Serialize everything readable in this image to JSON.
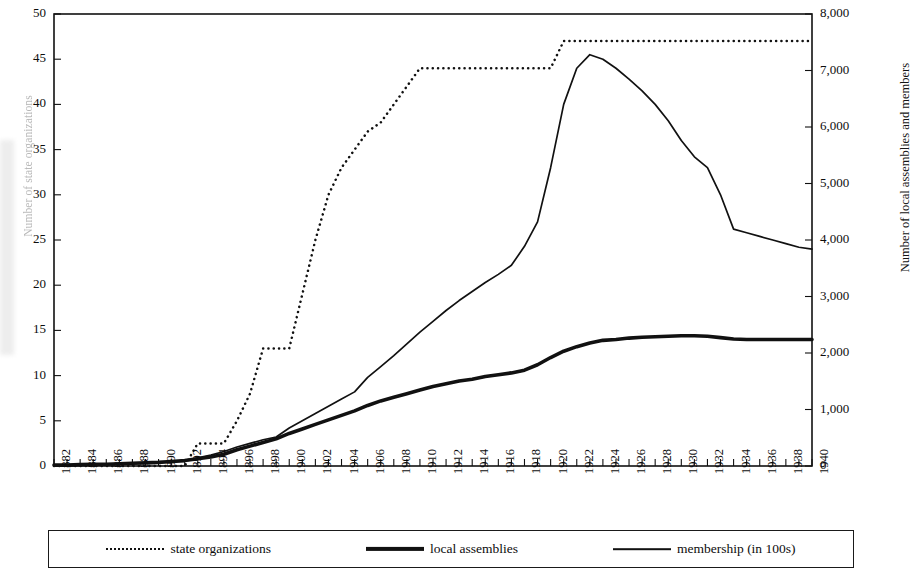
{
  "chart_data": {
    "type": "line",
    "title": "",
    "xlabel": "",
    "ylabel_left": "Number of state organizations",
    "ylabel_right": "Number of local assemblies and members",
    "xlim": [
      1882,
      1940
    ],
    "ylim_left": [
      0,
      50
    ],
    "ylim_right": [
      0,
      8000
    ],
    "grid": false,
    "legend_position": "bottom",
    "x_tick_labels": [
      "1882",
      "1884",
      "1886",
      "1888",
      "1890",
      "1892",
      "1894",
      "1896",
      "1898",
      "1900",
      "1902",
      "1904",
      "1906",
      "1908",
      "1910",
      "1912",
      "1914",
      "1916",
      "1918",
      "1920",
      "1922",
      "1924",
      "1926",
      "1928",
      "1930",
      "1932",
      "1934",
      "1936",
      "1938",
      "1940"
    ],
    "y_tick_labels_left": [
      "0",
      "5",
      "10",
      "15",
      "20",
      "25",
      "30",
      "35",
      "40",
      "45",
      "50"
    ],
    "y_tick_labels_right": [
      "0",
      "1,000",
      "2,000",
      "3,000",
      "4,000",
      "5,000",
      "6,000",
      "7,000",
      "8,000"
    ],
    "y_ticks_left": [
      0,
      5,
      10,
      15,
      20,
      25,
      30,
      35,
      40,
      45,
      50
    ],
    "y_ticks_right": [
      0,
      1000,
      2000,
      3000,
      4000,
      5000,
      6000,
      7000,
      8000
    ],
    "x": [
      1882,
      1883,
      1884,
      1885,
      1886,
      1887,
      1888,
      1889,
      1890,
      1891,
      1892,
      1893,
      1894,
      1895,
      1896,
      1897,
      1898,
      1899,
      1900,
      1901,
      1902,
      1903,
      1904,
      1905,
      1906,
      1907,
      1908,
      1909,
      1910,
      1911,
      1912,
      1913,
      1914,
      1915,
      1916,
      1917,
      1918,
      1919,
      1920,
      1921,
      1922,
      1923,
      1924,
      1925,
      1926,
      1927,
      1928,
      1929,
      1930,
      1931,
      1932,
      1933,
      1934,
      1935,
      1936,
      1937,
      1938,
      1939,
      1940
    ],
    "series": [
      {
        "name": "state organizations",
        "style": "dotted",
        "axis": "left",
        "values": [
          0,
          0,
          0,
          0,
          0,
          0,
          0,
          0,
          0,
          0,
          0,
          2.5,
          2.5,
          2.5,
          5,
          8,
          13,
          13,
          13,
          19,
          25,
          30,
          33,
          35,
          37,
          38,
          40,
          42,
          44,
          44,
          44,
          44,
          44,
          44,
          44,
          44,
          44,
          44,
          44,
          47,
          47,
          47,
          47,
          47,
          47,
          47,
          47,
          47,
          47,
          47,
          47,
          47,
          47,
          47,
          47,
          47,
          47,
          47,
          47
        ]
      },
      {
        "name": "local assemblies",
        "style": "thick",
        "axis": "left",
        "values": [
          0.1,
          0.1,
          0.15,
          0.2,
          0.2,
          0.25,
          0.3,
          0.35,
          0.4,
          0.5,
          0.6,
          0.8,
          1.0,
          1.3,
          1.8,
          2.2,
          2.6,
          3.0,
          3.6,
          4.1,
          4.6,
          5.1,
          5.6,
          6.1,
          6.7,
          7.2,
          7.6,
          8.0,
          8.4,
          8.8,
          9.1,
          9.4,
          9.6,
          9.9,
          10.1,
          10.3,
          10.6,
          11.2,
          12.0,
          12.7,
          13.2,
          13.6,
          13.9,
          14.0,
          14.15,
          14.25,
          14.3,
          14.35,
          14.4,
          14.4,
          14.35,
          14.2,
          14.05,
          14.0,
          14.0,
          14.0,
          14.0,
          14.0,
          14.0
        ]
      },
      {
        "name": "membership (in 100s)",
        "style": "thin",
        "axis": "left",
        "values": [
          0.1,
          0.1,
          0.15,
          0.2,
          0.2,
          0.25,
          0.3,
          0.35,
          0.4,
          0.5,
          0.6,
          0.9,
          1.2,
          1.6,
          2.1,
          2.5,
          2.9,
          3.2,
          4.2,
          5.0,
          5.8,
          6.6,
          7.4,
          8.2,
          9.8,
          11.0,
          12.2,
          13.5,
          14.8,
          16.0,
          17.2,
          18.3,
          19.3,
          20.3,
          21.2,
          22.2,
          24.3,
          27.0,
          33.0,
          40.0,
          44.0,
          45.5,
          45.0,
          44.0,
          42.8,
          41.5,
          40.0,
          38.2,
          36.0,
          34.2,
          33.0,
          30.0,
          26.2,
          25.8,
          25.4,
          25.0,
          24.6,
          24.2,
          24.0
        ]
      }
    ],
    "legend": [
      {
        "label": "state organizations",
        "style": "dotted"
      },
      {
        "label": "local assemblies",
        "style": "thick"
      },
      {
        "label": "membership (in 100s)",
        "style": "thin"
      }
    ]
  }
}
